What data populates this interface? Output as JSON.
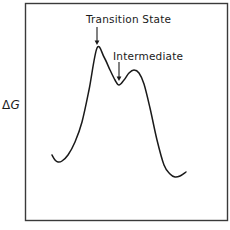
{
  "figure": {
    "type": "reaction-coordinate-energy-diagram",
    "background_color": "#ffffff",
    "line_color": "#1a1a1a",
    "frame_color": "#3a3a3a"
  },
  "axes": {
    "ylabel_delta": "Δ",
    "ylabel_symbol": "G",
    "ylabel_full": "ΔG",
    "xlabel": "",
    "frame": {
      "x": 25,
      "y": 3,
      "width": 202,
      "height": 217
    },
    "grid": false,
    "ticks": []
  },
  "annotations": [
    {
      "name": "transition-state",
      "label": "Transition State",
      "text_x": 86,
      "text_y": 13,
      "arrow": {
        "x1": 97,
        "y1": 27,
        "x2": 97,
        "y2": 45
      }
    },
    {
      "name": "intermediate",
      "label": "Intermediate",
      "text_x": 113,
      "text_y": 50,
      "arrow": {
        "x1": 119,
        "y1": 62,
        "x2": 119,
        "y2": 81
      }
    }
  ],
  "chart_data": {
    "type": "line",
    "title": "",
    "xlabel": "",
    "ylabel": "ΔG",
    "grid": false,
    "legend": null,
    "series": [
      {
        "name": "free-energy-profile",
        "x": [
          52,
          55,
          58,
          62,
          68,
          75,
          82,
          89,
          97,
          104,
          110,
          115,
          119,
          124,
          129,
          134,
          139,
          144,
          150,
          157,
          164,
          170,
          175,
          180,
          186
        ],
        "y": [
          155,
          160,
          162,
          161,
          155,
          142,
          122,
          90,
          48,
          57,
          70,
          80,
          85,
          80,
          73,
          70,
          73,
          84,
          108,
          140,
          165,
          174,
          177,
          176,
          172
        ]
      }
    ],
    "features": [
      {
        "name": "reactant-well",
        "label": "",
        "x": 58,
        "y": 162
      },
      {
        "name": "transition-state-peak",
        "label": "Transition State",
        "x": 97,
        "y": 48
      },
      {
        "name": "intermediate-well",
        "label": "Intermediate",
        "x": 119,
        "y": 85
      },
      {
        "name": "second-transition-state-peak",
        "label": "",
        "x": 134,
        "y": 70
      },
      {
        "name": "product-well",
        "label": "",
        "x": 175,
        "y": 177
      }
    ],
    "axis_inverted_y": true,
    "note": "y values are pixel coordinates; smaller y = higher free energy"
  }
}
